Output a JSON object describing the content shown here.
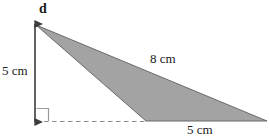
{
  "figure": {
    "labels": {
      "vertex_d": "d",
      "height": "5 cm",
      "hypotenuse": "8 cm",
      "base": "5 cm"
    },
    "colors": {
      "fill": "#a3a3a3",
      "stroke": "#6b6b6b",
      "arrow": "#3d3d3d",
      "dashed": "#8c8c8c",
      "text": "#1a1a1a",
      "background": "#ffffff"
    },
    "geometry": {
      "shape": "triangle",
      "apex": [
        36,
        25
      ],
      "bottom_left_vertex": [
        146,
        121
      ],
      "right_vertex": [
        267,
        121
      ],
      "height_arrow": {
        "x": 35,
        "y_top": 24,
        "y_bottom": 122
      },
      "dashed_baseline": {
        "y": 121,
        "x_start": 36,
        "x_end": 146
      },
      "right_angle_marker": {
        "x": 36,
        "y": 108,
        "size": 13
      }
    },
    "measurements": {
      "height_cm": 5,
      "slant_side_cm": 8,
      "base_cm": 5
    }
  }
}
